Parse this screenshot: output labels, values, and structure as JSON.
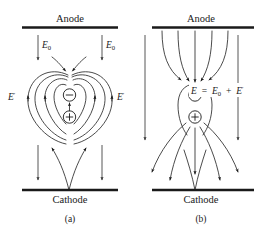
{
  "figure": {
    "background_color": "#ffffff",
    "ink_color": "#1a1a1a",
    "panels": [
      {
        "id": "a",
        "caption": "(a)",
        "anode_label": "Anode",
        "cathode_label": "Cathode",
        "negative_charge_symbol": "circled-minus",
        "positive_charge_symbol": "circled-plus",
        "labels": [
          {
            "name": "e0-left",
            "symbol": "E",
            "subscript": "0",
            "prime": ""
          },
          {
            "name": "e0-right",
            "symbol": "E",
            "subscript": "0",
            "prime": ""
          },
          {
            "name": "eprime-left",
            "symbol": "E",
            "subscript": "",
            "prime": "′"
          },
          {
            "name": "eprime-right",
            "symbol": "E",
            "subscript": "",
            "prime": "′"
          }
        ]
      },
      {
        "id": "b",
        "caption": "(b)",
        "anode_label": "Anode",
        "cathode_label": "Cathode",
        "negative_charge_symbol": "circled-minus",
        "positive_charge_symbol": "circled-plus",
        "equation": {
          "lhs": "E",
          "equals": "=",
          "term1": "E",
          "term1_subscript": "0",
          "plus": "+",
          "term2": "E",
          "term2_prime": "′",
          "full_text": "E = E0 + E′"
        }
      }
    ]
  }
}
